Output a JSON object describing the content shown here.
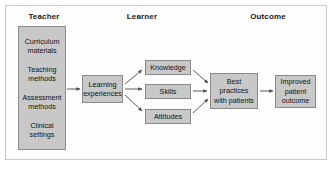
{
  "diagram": {
    "title_visible": false,
    "frame": {
      "border_color": "#c9c9c9",
      "background": "#fdfdfd"
    },
    "node_style": {
      "fill": "#c8c8c8",
      "stroke": "#8a8a8a",
      "text": "#111111"
    },
    "arrow_color": "#4a4a4a",
    "columns": [
      {
        "id": "teacher",
        "label": "Teacher"
      },
      {
        "id": "learner",
        "label": "Learner"
      },
      {
        "id": "outcome",
        "label": "Outcome"
      }
    ],
    "nodes": [
      {
        "id": "teacher-inputs",
        "column": "teacher",
        "items": [
          {
            "lines": [
              "Curriculum",
              "materials"
            ]
          },
          {
            "lines": [
              "Teaching",
              "methods"
            ]
          },
          {
            "lines": [
              "Assessment",
              "methods"
            ]
          },
          {
            "lines": [
              "Clinical",
              "settings"
            ]
          }
        ]
      },
      {
        "id": "learning-experiences",
        "column": "learner",
        "lines": [
          "Learning",
          "experiences"
        ]
      },
      {
        "id": "knowledge",
        "column": "learner",
        "lines": [
          "Knowledge"
        ]
      },
      {
        "id": "skills",
        "column": "learner",
        "lines": [
          "Skills"
        ]
      },
      {
        "id": "attitudes",
        "column": "learner",
        "lines": [
          "Attitudes"
        ]
      },
      {
        "id": "best-practices",
        "column": "outcome",
        "lines": [
          "Best",
          "practices",
          "with patients"
        ]
      },
      {
        "id": "improved-outcome",
        "column": "outcome",
        "lines": [
          "Improved",
          "patient",
          "outcome"
        ]
      }
    ],
    "edges": [
      {
        "from": "teacher-inputs",
        "to": "learning-experiences"
      },
      {
        "from": "learning-experiences",
        "to": "knowledge"
      },
      {
        "from": "learning-experiences",
        "to": "skills"
      },
      {
        "from": "learning-experiences",
        "to": "attitudes"
      },
      {
        "from": "knowledge",
        "to": "best-practices"
      },
      {
        "from": "skills",
        "to": "best-practices"
      },
      {
        "from": "attitudes",
        "to": "best-practices"
      },
      {
        "from": "best-practices",
        "to": "improved-outcome"
      }
    ]
  },
  "labels": {
    "teacher": "Teacher",
    "learner": "Learner",
    "outcome": "Outcome",
    "curriculum_1": "Curriculum",
    "curriculum_2": "materials",
    "teaching_1": "Teaching",
    "teaching_2": "methods",
    "assessment_1": "Assessment",
    "assessment_2": "methods",
    "clinical_1": "Clinical",
    "clinical_2": "settings",
    "learning_1": "Learning",
    "learning_2": "experiences",
    "knowledge": "Knowledge",
    "skills": "Skills",
    "attitudes": "Attitudes",
    "best_1": "Best",
    "best_2": "practices",
    "best_3": "with patients",
    "improved_1": "Improved",
    "improved_2": "patient",
    "improved_3": "outcome"
  }
}
